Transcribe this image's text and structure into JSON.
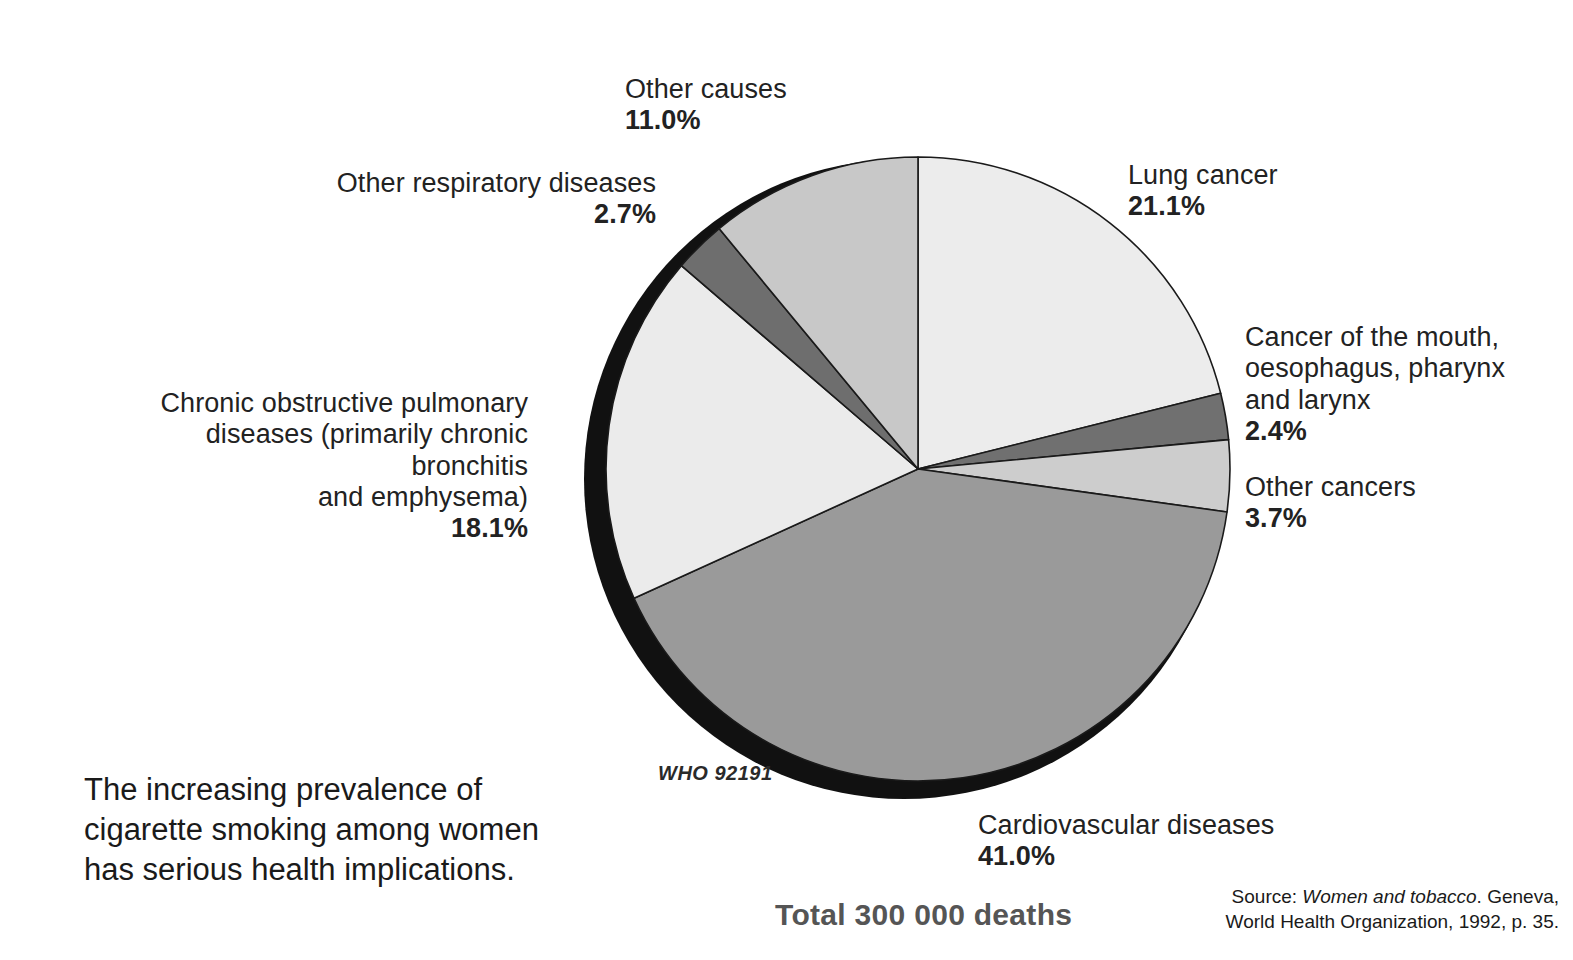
{
  "chart_data": {
    "type": "pie",
    "title": "",
    "total_label": "Total 300 000 deaths",
    "total_deaths": 300000,
    "units": "percent of deaths",
    "legend_position": "callout labels around pie",
    "categories": [
      "Lung cancer",
      "Cancer of the mouth, oesophagus, pharynx and larynx",
      "Other cancers",
      "Cardiovascular diseases",
      "Chronic obstructive pulmonary diseases (primarily chronic bronchitis and emphysema)",
      "Other respiratory diseases",
      "Other causes"
    ],
    "values": [
      21.1,
      2.4,
      3.7,
      41.0,
      18.1,
      2.7,
      11.0
    ],
    "slices": [
      {
        "label": "Lung cancer",
        "value": 21.1,
        "value_text": "21.1%",
        "color": "#ececec"
      },
      {
        "label": "Cancer of the mouth, oesophagus, pharynx and larynx",
        "value": 2.4,
        "value_text": "2.4%",
        "color": "#707070"
      },
      {
        "label": "Other cancers",
        "value": 3.7,
        "value_text": "3.7%",
        "color": "#cdcdcd"
      },
      {
        "label": "Cardiovascular diseases",
        "value": 41.0,
        "value_text": "41.0%",
        "color": "#9a9a9a"
      },
      {
        "label": "Chronic obstructive pulmonary diseases (primarily chronic bronchitis and emphysema)",
        "value": 18.1,
        "value_text": "18.1%",
        "color": "#ebebeb"
      },
      {
        "label": "Other respiratory diseases",
        "value": 2.7,
        "value_text": "2.7%",
        "color": "#6e6e6e"
      },
      {
        "label": "Other causes",
        "value": 11.0,
        "value_text": "11.0%",
        "color": "#c8c8c8"
      }
    ],
    "start_angle_deg": 0,
    "direction": "clockwise",
    "shadow_color": "#111111"
  },
  "labels": {
    "other_causes": {
      "name": "Other causes",
      "pct": "11.0%"
    },
    "other_respiratory": {
      "name": "Other respiratory diseases",
      "pct": "2.7%"
    },
    "copd": {
      "name_line1": "Chronic obstructive pulmonary",
      "name_line2": "diseases (primarily chronic bronchitis",
      "name_line3": "and emphysema)",
      "pct": "18.1%"
    },
    "lung_cancer": {
      "name": "Lung cancer",
      "pct": "21.1%"
    },
    "mouth_cancer": {
      "name_line1": "Cancer of the mouth,",
      "name_line2": "oesophagus, pharynx",
      "name_line3": "and larynx",
      "pct": "2.4%"
    },
    "other_cancers": {
      "name": "Other cancers",
      "pct": "3.7%"
    },
    "cardiovascular": {
      "name": "Cardiovascular diseases",
      "pct": "41.0%"
    }
  },
  "annotations": {
    "who_code": "WHO  92191",
    "caption": "The increasing prevalence of cigarette smoking among women has serious health implications.",
    "total": "Total 300 000 deaths",
    "source_prefix": "Source: ",
    "source_title": "Women and tobacco",
    "source_rest": ". Geneva, World Health Organization, 1992, p. 35."
  },
  "colors": {
    "background": "#ffffff",
    "text": "#1a1a1a",
    "total_text": "#555555",
    "shadow": "#111111"
  }
}
